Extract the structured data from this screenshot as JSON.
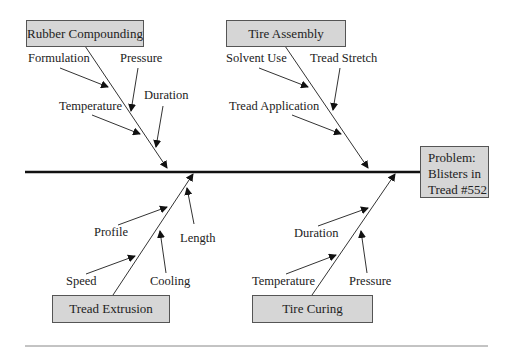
{
  "diagram": {
    "type": "fishbone",
    "problem": {
      "line1": "Problem:",
      "line2": "Blisters in",
      "line3": "Tread #552"
    },
    "categories": [
      {
        "name": "Rubber Compounding",
        "position": "top-left",
        "causes": [
          "Formulation",
          "Pressure",
          "Temperature",
          "Duration"
        ]
      },
      {
        "name": "Tire Assembly",
        "position": "top-right",
        "causes": [
          "Solvent Use",
          "Tread Stretch",
          "Tread Application"
        ]
      },
      {
        "name": "Tread Extrusion",
        "position": "bottom-left",
        "causes": [
          "Profile",
          "Length",
          "Speed",
          "Cooling"
        ]
      },
      {
        "name": "Tire Curing",
        "position": "bottom-right",
        "causes": [
          "Duration",
          "Temperature",
          "Pressure"
        ]
      }
    ]
  },
  "colors": {
    "box_fill": "#d6d6d6",
    "line": "#222222",
    "rule": "#888888"
  }
}
